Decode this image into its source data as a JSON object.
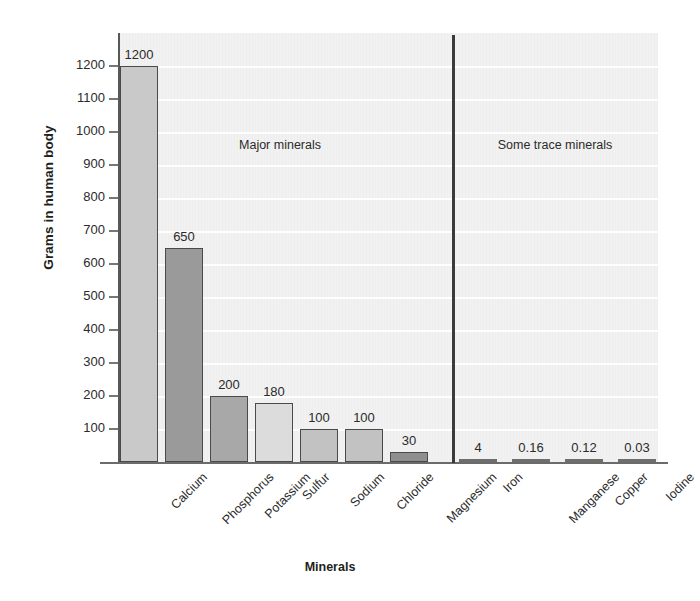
{
  "chart_data": {
    "type": "bar",
    "title": "",
    "xlabel": "Minerals",
    "ylabel": "Grams in human body",
    "ylim": [
      0,
      1260
    ],
    "yticks": [
      100,
      200,
      300,
      400,
      500,
      600,
      700,
      800,
      900,
      1000,
      1100,
      1200
    ],
    "grid": true,
    "legend": "none",
    "categories": [
      "Calcium",
      "Phosphorus",
      "Potassium",
      "Sulfur",
      "Sodium",
      "Chloride",
      "Magnesium",
      "Iron",
      "Manganese",
      "Copper",
      "Iodine"
    ],
    "values": [
      1200,
      650,
      200,
      180,
      100,
      100,
      30,
      4,
      0.16,
      0.12,
      0.03
    ],
    "value_labels": [
      "1200",
      "650",
      "200",
      "180",
      "100",
      "100",
      "30",
      "4",
      "0.16",
      "0.12",
      "0.03"
    ],
    "bar_colors": [
      "#c9c9c9",
      "#9a9a9a",
      "#a8a8a8",
      "#dcdcdc",
      "#c2c2c2",
      "#c2c2c2",
      "#8f8f8f",
      "#8a8a8a",
      "#8a8a8a",
      "#8a8a8a",
      "#8a8a8a"
    ],
    "groups": [
      {
        "label": "Major minerals",
        "categories": [
          "Calcium",
          "Phosphorus",
          "Potassium",
          "Sulfur",
          "Sodium",
          "Chloride",
          "Magnesium"
        ]
      },
      {
        "label": "Some trace minerals",
        "categories": [
          "Iron",
          "Manganese",
          "Copper",
          "Iodine"
        ]
      }
    ],
    "annotations": {
      "divider": "vertical line separating major minerals from trace minerals"
    }
  },
  "style": {
    "plot_background": "#f1f1f1",
    "gridline_color": "#ffffff",
    "axis_color": "#585858",
    "text_color": "#2b2b2b"
  }
}
